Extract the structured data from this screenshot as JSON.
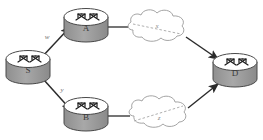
{
  "diagram": {
    "type": "network-topology",
    "background_color": "#ffffff",
    "nodes": [
      {
        "id": "S",
        "label": "S",
        "kind": "router-icon",
        "cx": 28,
        "cy": 66
      },
      {
        "id": "A",
        "label": "A",
        "kind": "router-icon",
        "cx": 86,
        "cy": 24
      },
      {
        "id": "B",
        "label": "B",
        "kind": "router-icon",
        "cx": 86,
        "cy": 113
      },
      {
        "id": "D",
        "label": "D",
        "kind": "router-icon",
        "cx": 235,
        "cy": 69
      }
    ],
    "clouds": [
      {
        "id": "cloud-upper",
        "label": "x",
        "cx": 158,
        "cy": 29
      },
      {
        "id": "cloud-lower",
        "label": "z",
        "cx": 160,
        "cy": 113
      }
    ],
    "edges": [
      {
        "id": "s-to-a",
        "from": "S",
        "to": "A",
        "label": "w",
        "style": "solid-arrow"
      },
      {
        "id": "s-to-b",
        "from": "S",
        "to": "B",
        "label": "y",
        "style": "solid-arrow"
      },
      {
        "id": "a-to-cloud-upper",
        "from": "A",
        "to": "cloud-upper",
        "label": "",
        "style": "solid-line"
      },
      {
        "id": "cloud-upper-to-d",
        "from": "cloud-upper",
        "to": "D",
        "label": "",
        "style": "solid-arrow"
      },
      {
        "id": "b-to-cloud-lower",
        "from": "B",
        "to": "cloud-lower",
        "label": "",
        "style": "solid-line"
      },
      {
        "id": "cloud-lower-to-d",
        "from": "cloud-lower",
        "to": "D",
        "label": "",
        "style": "solid-arrow"
      },
      {
        "id": "dashed-upper",
        "from": "cloud-upper-left",
        "to": "cloud-upper-right",
        "label": "",
        "style": "dashed-line"
      },
      {
        "id": "dashed-lower",
        "from": "cloud-lower-left",
        "to": "cloud-lower-right",
        "label": "",
        "style": "dashed-line"
      }
    ],
    "colors": {
      "router_body": "#9c9c9c",
      "router_top": "#ffffff",
      "router_outline": "#4a4a4a",
      "arrow": "#2b2b2b",
      "cloud_outline": "#9a9a9a",
      "dashed": "#9a9a9a",
      "label_text": "#3b3b3b",
      "edge_label_text": "#707070"
    }
  }
}
